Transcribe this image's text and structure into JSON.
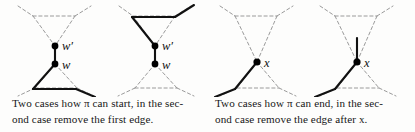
{
  "figure": {
    "background_color": "#fdfdfc",
    "solid_edge_color": "#111111",
    "dashed_edge_color": "#9a9a9a",
    "node_color": "#000000",
    "label_color": "#111111"
  },
  "panels": [
    {
      "id": "panel-start",
      "caption": {
        "line1": "Two cases how π can start, in the sec-",
        "line2": "ond case remove the first edge.",
        "full": "Two cases how π can start, in the second case remove the first edge."
      },
      "diagrams": [
        {
          "id": "start-case-1",
          "node_labels": [
            "w′",
            "w"
          ]
        },
        {
          "id": "start-case-2",
          "node_labels": [
            "w′",
            "w"
          ]
        }
      ]
    },
    {
      "id": "panel-end",
      "caption": {
        "line1": "Two cases how π can end, in the sec-",
        "line2": "ond case remove the edge after x.",
        "full": "Two cases how π can end, in the second case remove the edge after x."
      },
      "diagrams": [
        {
          "id": "end-case-1",
          "node_labels": [
            "x"
          ]
        },
        {
          "id": "end-case-2",
          "node_labels": [
            "x"
          ]
        }
      ]
    }
  ],
  "labels": {
    "w_prime": "w′",
    "w": "w",
    "x": "x"
  }
}
